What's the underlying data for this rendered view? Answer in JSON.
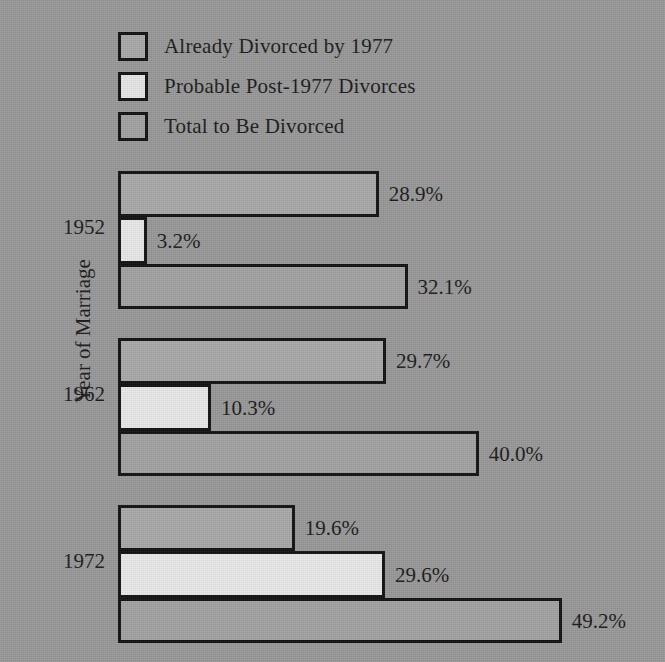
{
  "chart_data": {
    "type": "bar",
    "title": "",
    "subtitle": "",
    "orientation": "horizontal",
    "grid": false,
    "xlabel": "",
    "ylabel": "Year of Marriage",
    "categories": [
      "1952",
      "1962",
      "1972"
    ],
    "legend_position": "top-left",
    "value_suffix": "%",
    "axis_max": 55,
    "px_per_percent": 9.02,
    "series": [
      {
        "name": "Already Divorced by 1977",
        "key": "already",
        "color": "#a9a9a9",
        "values": [
          28.9,
          29.7,
          19.6
        ],
        "labels": [
          "28.9%",
          "29.7%",
          "19.6%"
        ]
      },
      {
        "name": "Probable Post-1977 Divorces",
        "key": "probable",
        "color": "#e9e9e9",
        "values": [
          3.2,
          10.3,
          29.6
        ],
        "labels": [
          "3.2%",
          "10.3%",
          "29.6%"
        ]
      },
      {
        "name": "Total to Be Divorced",
        "key": "total",
        "color": "#a2a2a2",
        "values": [
          32.1,
          40.0,
          49.2
        ],
        "labels": [
          "32.1%",
          "40.0%",
          "49.2%"
        ]
      }
    ]
  },
  "legend": {
    "items": [
      {
        "label": "Already Divorced by 1977",
        "swatch": "#a9a9a9"
      },
      {
        "label": "Probable Post-1977 Divorces",
        "swatch": "#e6e6e6"
      },
      {
        "label": "Total to Be Divorced",
        "swatch": "#a2a2a2"
      }
    ]
  },
  "axis": {
    "y_title": "Year of Marriage"
  },
  "groups": [
    {
      "year": "1952",
      "bars": [
        {
          "series": "Already Divorced by 1977",
          "value": 28.9,
          "label": "28.9%"
        },
        {
          "series": "Probable Post-1977 Divorces",
          "value": 3.2,
          "label": "3.2%"
        },
        {
          "series": "Total to Be Divorced",
          "value": 32.1,
          "label": "32.1%"
        }
      ]
    },
    {
      "year": "1962",
      "bars": [
        {
          "series": "Already Divorced by 1977",
          "value": 29.7,
          "label": "29.7%"
        },
        {
          "series": "Probable Post-1977 Divorces",
          "value": 10.3,
          "label": "10.3%"
        },
        {
          "series": "Total to Be Divorced",
          "value": 40.0,
          "label": "40.0%"
        }
      ]
    },
    {
      "year": "1972",
      "bars": [
        {
          "series": "Already Divorced by 1977",
          "value": 19.6,
          "label": "19.6%"
        },
        {
          "series": "Probable Post-1977 Divorces",
          "value": 29.6,
          "label": "29.6%"
        },
        {
          "series": "Total to Be Divorced",
          "value": 49.2,
          "label": "49.2%"
        }
      ]
    }
  ],
  "colors": {
    "background": "#989898",
    "outline": "#111111",
    "text": "#1a1a1a"
  }
}
